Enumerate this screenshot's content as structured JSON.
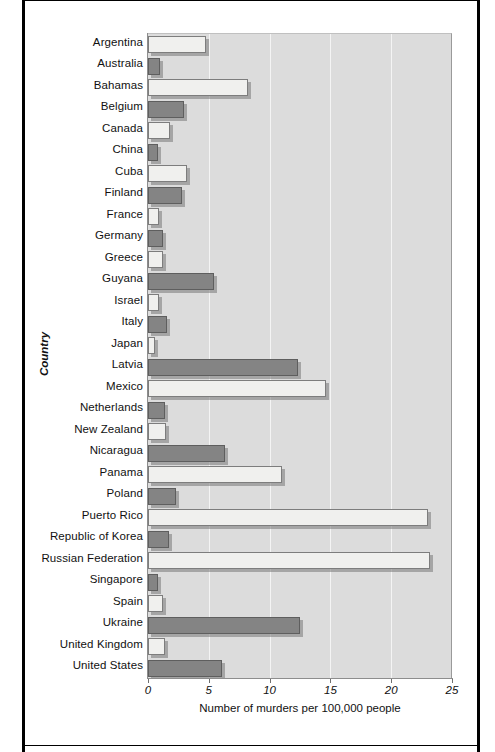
{
  "chart_data": {
    "type": "bar",
    "orientation": "horizontal",
    "title": "",
    "xlabel": "Number of murders per 100,000 people",
    "ylabel": "Country",
    "xlim": [
      0,
      25
    ],
    "xticks": [
      0,
      5,
      10,
      15,
      20,
      25
    ],
    "xtick_labels": [
      "0",
      "5",
      "10",
      "15",
      "20",
      "25"
    ],
    "grid": true,
    "grid_axis": "x",
    "legend": false,
    "categories": [
      "Argentina",
      "Australia",
      "Bahamas",
      "Belgium",
      "Canada",
      "China",
      "Cuba",
      "Finland",
      "France",
      "Germany",
      "Greece",
      "Guyana",
      "Israel",
      "Italy",
      "Japan",
      "Latvia",
      "Mexico",
      "Netherlands",
      "New Zealand",
      "Nicaragua",
      "Panama",
      "Poland",
      "Puerto Rico",
      "Republic of Korea",
      "Russian Federation",
      "Singapore",
      "Spain",
      "Ukraine",
      "United Kingdom",
      "United States"
    ],
    "values": [
      4.8,
      1.0,
      8.2,
      3.0,
      1.8,
      0.8,
      3.2,
      2.8,
      0.9,
      1.2,
      1.2,
      5.4,
      0.9,
      1.6,
      0.6,
      12.3,
      14.6,
      1.4,
      1.5,
      6.3,
      11.0,
      2.3,
      23.0,
      1.7,
      23.2,
      0.8,
      1.2,
      12.5,
      1.4,
      6.1
    ],
    "bar_styles": [
      "light",
      "dark",
      "light",
      "dark",
      "light",
      "dark",
      "light",
      "dark",
      "light",
      "dark",
      "light",
      "dark",
      "light",
      "dark",
      "light",
      "dark",
      "light",
      "dark",
      "light",
      "dark",
      "light",
      "dark",
      "light",
      "dark",
      "light",
      "dark",
      "light",
      "dark",
      "light",
      "dark"
    ],
    "colors": {
      "light_bar": "#f0f0ee",
      "dark_bar": "#848484",
      "plot_background": "#dcdcdc",
      "gridline": "#f4f4f4",
      "axis": "#8d8d8d",
      "text": "#111111",
      "frame": "#000000"
    }
  }
}
